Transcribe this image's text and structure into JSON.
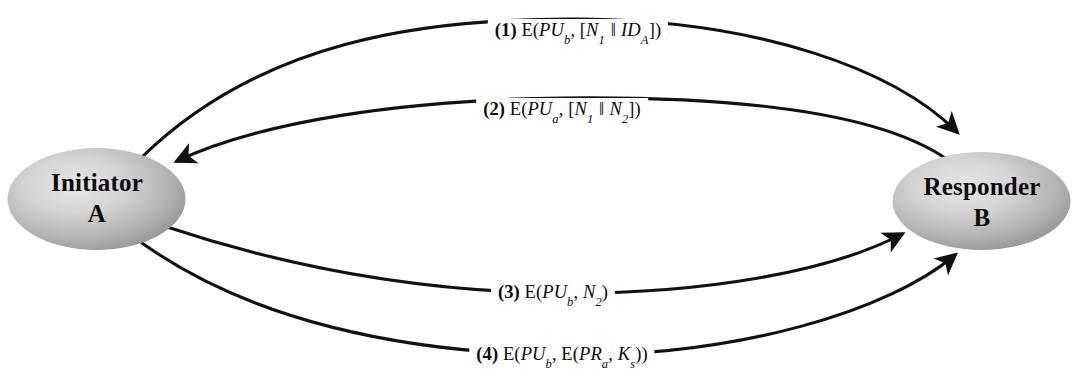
{
  "diagram": {
    "background_color": "#ffffff",
    "line_color": "#111111",
    "nodes": {
      "initiator": {
        "name": "initiator-node",
        "line1": "Initiator",
        "line2": "A",
        "shape": "ellipse",
        "fill_center": "#dedede",
        "fill_edge": "#979797",
        "cx": 96.5,
        "cy": 199,
        "rx": 89,
        "ry": 51
      },
      "responder": {
        "name": "responder-node",
        "line1": "Responder",
        "line2": "B",
        "shape": "ellipse",
        "fill_center": "#dedede",
        "fill_edge": "#979797",
        "cx": 981.5,
        "cy": 201,
        "rx": 89,
        "ry": 49
      }
    },
    "messages": [
      {
        "id": "msg-1",
        "number": "(1)",
        "prefix": "E(",
        "key": "PU",
        "key_sub": "b",
        "body_open": ", [",
        "arg1": "N",
        "arg1_sub": "1",
        "separator": "‖",
        "arg2": "ID",
        "arg2_sub": "A",
        "body_close": "])",
        "plain": "(1) E(PUb, [N1 ‖ IDA])",
        "direction": "initiator-to-responder",
        "arrow_at": "responder"
      },
      {
        "id": "msg-2",
        "number": "(2)",
        "prefix": "E(",
        "key": "PU",
        "key_sub": "a",
        "body_open": ", [",
        "arg1": "N",
        "arg1_sub": "1",
        "separator": "‖",
        "arg2": "N",
        "arg2_sub": "2",
        "body_close": "])",
        "plain": "(2) E(PUa, [N1 ‖ N2])",
        "direction": "responder-to-initiator",
        "arrow_at": "initiator"
      },
      {
        "id": "msg-3",
        "number": "(3)",
        "prefix": "E(",
        "key": "PU",
        "key_sub": "b",
        "body_open": ", ",
        "arg1": "N",
        "arg1_sub": "2",
        "body_close": ")",
        "plain": "(3) E(PUb, N2)",
        "direction": "initiator-to-responder",
        "arrow_at": "responder"
      },
      {
        "id": "msg-4",
        "number": "(4)",
        "prefix": "E(",
        "key": "PU",
        "key_sub": "b",
        "body_open": ", E(",
        "arg1": "PR",
        "arg1_sub": "a",
        "mid": ", ",
        "arg2": "K",
        "arg2_sub": "s",
        "body_close": "))",
        "plain": "(4) E(PUb, E(PRa, Ks))",
        "direction": "initiator-to-responder",
        "arrow_at": "responder"
      }
    ]
  }
}
